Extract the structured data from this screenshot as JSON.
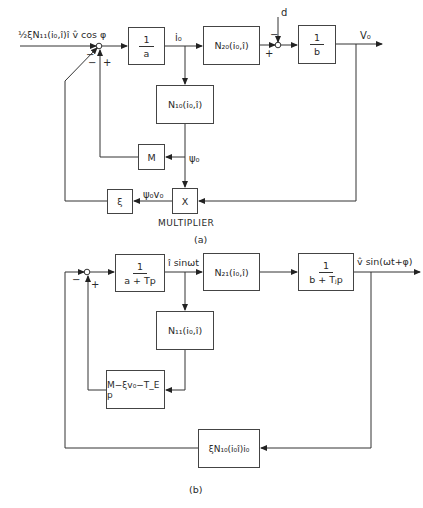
{
  "diagram_a": {
    "caption": "(a)",
    "input_label": "½ξN₁₁(i₀,î)î v̂ cos φ",
    "junction1_signs": {
      "left": "−",
      "lower_left": "−",
      "lower_right": "+"
    },
    "blocks": {
      "gain_a": {
        "num": "1",
        "den": "a"
      },
      "n20": "N₂₀(i₀,î)",
      "gain_b": {
        "num": "1",
        "den": "b"
      },
      "n10": "N₁₀(i₀,î)",
      "m": "M",
      "multiplier": "X",
      "xi": "ξ"
    },
    "signals": {
      "i0": "i₀",
      "d": "d",
      "v0": "V₀",
      "psi0": "ψ₀",
      "psi0v0": "ψ₀v₀"
    },
    "junction2_signs": {
      "top": "−",
      "left": "+"
    },
    "multiplier_label": "MULTIPLIER"
  },
  "diagram_b": {
    "caption": "(b)",
    "junction_signs": {
      "left": "−",
      "bottom": "+"
    },
    "blocks": {
      "gain_a": {
        "num": "1",
        "den": "a + Tp"
      },
      "n21": "N₂₁(i₀,î)",
      "gain_b": {
        "num": "1",
        "den": "b + Tⱼp"
      },
      "n11": "N₁₁(i₀,î)",
      "feedback_m": "M−ξv₀−T_E p",
      "feedback_xi": "ξN₁₀(i₀î)i₀"
    },
    "signals": {
      "i_sin": "î sinωt",
      "v_sin": "v̂ sin(ωt+φ)"
    }
  }
}
